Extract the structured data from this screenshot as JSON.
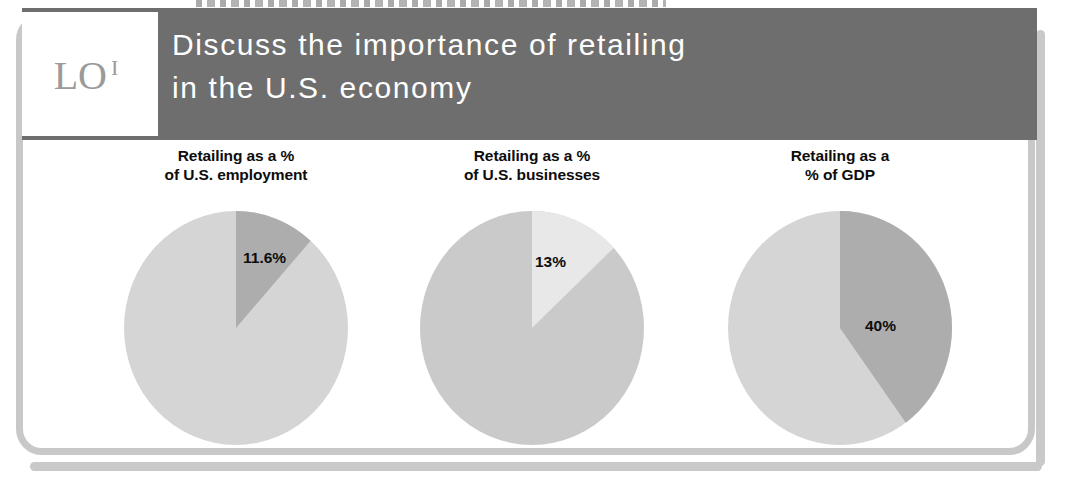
{
  "slide": {
    "badge": {
      "text": "LO",
      "superscript": "I",
      "name": "learning-objective-badge"
    },
    "header": {
      "line1": "Discuss the importance of retailing",
      "line2": "in the U.S. economy"
    },
    "colors": {
      "header_band": "#6e6e6e",
      "frame_border": "#c8c8c8",
      "pie_base_light": "#d5d5d5",
      "pie_base_mid": "#cacaca",
      "pie_highlight_dark": "#adadad",
      "pie_highlight_light": "#e8e8e8",
      "title_text": "#0d0d0d",
      "header_text": "#ffffff"
    }
  },
  "chart_data": [
    {
      "type": "pie",
      "title": "Retailing as a % of U.S. employment",
      "title_line1": "Retailing as a %",
      "title_line2": "of U.S. employment",
      "categories": [
        "Retailing",
        "Other"
      ],
      "values": [
        11.6,
        88.4
      ],
      "labels": [
        "11.6%",
        ""
      ],
      "visible_label": "11.6%",
      "slice_colors": [
        "#adadad",
        "#d5d5d5"
      ],
      "start_angle_deg": 0,
      "direction": "clockwise",
      "legend": "none",
      "grid": false
    },
    {
      "type": "pie",
      "title": "Retailing as a % of U.S. businesses",
      "title_line1": "Retailing as a %",
      "title_line2": "of U.S. businesses",
      "categories": [
        "Retailing",
        "Other"
      ],
      "values": [
        13,
        87
      ],
      "labels": [
        "13%",
        ""
      ],
      "visible_label": "13%",
      "slice_colors": [
        "#e8e8e8",
        "#cacaca"
      ],
      "start_angle_deg": 0,
      "direction": "clockwise",
      "legend": "none",
      "grid": false
    },
    {
      "type": "pie",
      "title": "Retailing as a % of GDP",
      "title_line1": "Retailing as a",
      "title_line2": "% of GDP",
      "categories": [
        "Retailing",
        "Other"
      ],
      "values": [
        40,
        60
      ],
      "labels": [
        "40%",
        ""
      ],
      "visible_label": "40%",
      "slice_colors": [
        "#adadad",
        "#d5d5d5"
      ],
      "start_angle_deg": 0,
      "direction": "clockwise",
      "legend": "none",
      "grid": false
    }
  ]
}
